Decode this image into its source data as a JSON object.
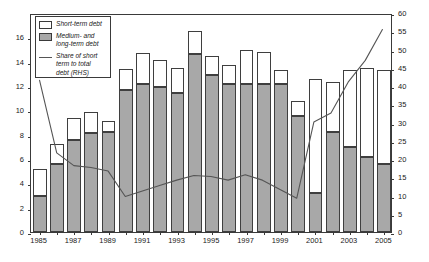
{
  "chart_data": {
    "type": "bar",
    "title": "",
    "subtitle": "",
    "xlabel": "",
    "ylabel": "",
    "y2label": "",
    "grid": false,
    "legend_position": "top-left",
    "categories": [
      "1985",
      "1986",
      "1987",
      "1988",
      "1989",
      "1990",
      "1991",
      "1992",
      "1993",
      "1994",
      "1995",
      "1996",
      "1997",
      "1998",
      "1999",
      "2000",
      "2001",
      "2002",
      "2003",
      "2004",
      "2005"
    ],
    "x_tick_labels": [
      "1985",
      "1987",
      "1989",
      "1991",
      "1993",
      "1995",
      "1997",
      "1999",
      "2001",
      "2003",
      "2005"
    ],
    "ylim": [
      0,
      18
    ],
    "y_ticks": [
      0,
      2,
      4,
      6,
      8,
      10,
      12,
      14,
      16
    ],
    "y2lim": [
      0,
      60
    ],
    "y2_ticks": [
      0,
      5,
      10,
      15,
      20,
      25,
      30,
      35,
      40,
      45,
      50,
      55,
      60
    ],
    "series": [
      {
        "name": "Medium- and long-term debt",
        "type": "bar-stacked",
        "axis": "left",
        "color": "#a8a8a8",
        "values": [
          3.0,
          5.6,
          7.6,
          8.1,
          8.2,
          11.7,
          12.2,
          11.9,
          11.4,
          14.6,
          12.9,
          12.2,
          12.2,
          12.2,
          12.2,
          9.5,
          3.2,
          8.2,
          7.0,
          6.2,
          5.6
        ]
      },
      {
        "name": "Short-term debt",
        "type": "bar-stacked",
        "axis": "left",
        "color": "#ffffff",
        "values": [
          2.2,
          1.6,
          1.8,
          1.8,
          0.9,
          1.7,
          2.5,
          2.2,
          2.1,
          1.9,
          1.6,
          1.5,
          2.8,
          2.6,
          1.1,
          1.3,
          9.4,
          4.1,
          6.3,
          7.3,
          7.7
        ]
      },
      {
        "name": "Share of short term to total debt (RHS)",
        "type": "line",
        "axis": "right",
        "color": "#555555",
        "values": [
          42.0,
          22.0,
          18.5,
          18.0,
          17.0,
          10.0,
          11.5,
          13.0,
          14.5,
          15.8,
          15.5,
          14.5,
          16.0,
          14.5,
          12.0,
          9.5,
          30.5,
          33.0,
          41.5,
          47.5,
          56.0
        ]
      }
    ],
    "legend_entries": [
      {
        "label": "Short-term debt",
        "swatch": "white-box"
      },
      {
        "label": "Medium- and long-term debt",
        "swatch": "gray-box"
      },
      {
        "label": "Share of short term to total debt (RHS)",
        "swatch": "line"
      }
    ]
  },
  "legend": {
    "entry_short_term": "Short-term debt",
    "entry_mlt_line1": "Medium- and",
    "entry_mlt_line2": "long-term debt",
    "entry_share_line1": "Share of short",
    "entry_share_line2": "term to total",
    "entry_share_line3": "debt (RHS)"
  },
  "axes": {
    "left_ticks": [
      "0",
      "2",
      "4",
      "6",
      "8",
      "10",
      "12",
      "14",
      "16"
    ],
    "right_ticks": [
      "0",
      "5",
      "10",
      "15",
      "20",
      "25",
      "30",
      "35",
      "40",
      "45",
      "50",
      "55",
      "60"
    ],
    "x_ticks": [
      "1985",
      "1987",
      "1989",
      "1991",
      "1993",
      "1995",
      "1997",
      "1999",
      "2001",
      "2003",
      "2005"
    ]
  }
}
